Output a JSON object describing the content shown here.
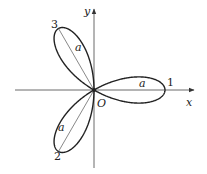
{
  "diagram": {
    "equation": "r = a cos 3θ",
    "axes": {
      "x_label": "x",
      "y_label": "y",
      "origin_label": "O"
    },
    "leaves": [
      {
        "id": "1",
        "label": "1",
        "angle_deg": 0,
        "length_label": "a"
      },
      {
        "id": "2",
        "label": "2",
        "angle_deg": 240,
        "length_label": "a"
      },
      {
        "id": "3",
        "label": "3",
        "angle_deg": 120,
        "length_label": "a"
      }
    ],
    "colors": {
      "curve": "#222222",
      "axes": "#444444",
      "radius_line": "#555555"
    },
    "geometry": {
      "origin_px": [
        94,
        90
      ],
      "a_px": 71
    }
  }
}
